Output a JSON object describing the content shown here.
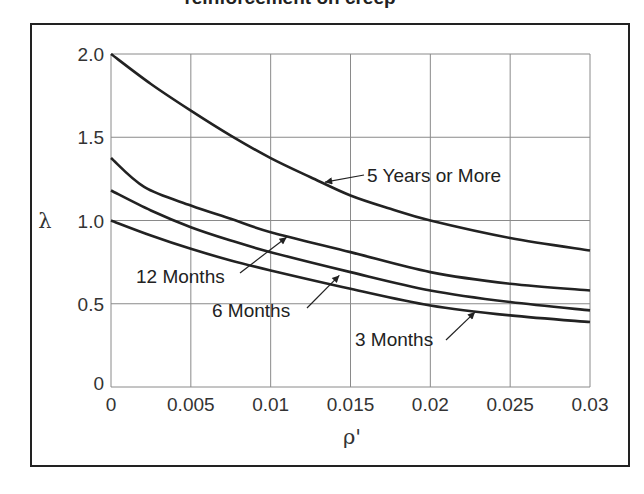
{
  "chart_data": {
    "type": "line",
    "title_visible_fragment": "reinforcement on creep",
    "xlabel": "ρ'",
    "ylabel": "λ",
    "xlim": [
      0,
      0.03
    ],
    "ylim": [
      0,
      2.0
    ],
    "grid": true,
    "x_ticks": [
      "0",
      "0.005",
      "0.01",
      "0.015",
      "0.02",
      "0.025",
      "0.03"
    ],
    "y_ticks": [
      "0",
      "0.5",
      "1.0",
      "1.5",
      "2.0"
    ],
    "x_tick_values": [
      0,
      0.005,
      0.01,
      0.015,
      0.02,
      0.025,
      0.03
    ],
    "y_tick_values": [
      0,
      0.5,
      1.0,
      1.5,
      2.0
    ],
    "series": [
      {
        "name": "5 Years or More",
        "x": [
          0,
          0.0025,
          0.005,
          0.0075,
          0.01,
          0.0125,
          0.015,
          0.0175,
          0.02,
          0.025,
          0.03
        ],
        "values": [
          2.0,
          1.82,
          1.66,
          1.51,
          1.375,
          1.26,
          1.15,
          1.07,
          1.0,
          0.895,
          0.82
        ]
      },
      {
        "name": "12 Months",
        "x": [
          0,
          0.0021,
          0.005,
          0.0075,
          0.01,
          0.015,
          0.02,
          0.025,
          0.03
        ],
        "values": [
          1.375,
          1.2,
          1.09,
          1.01,
          0.93,
          0.81,
          0.69,
          0.62,
          0.58
        ]
      },
      {
        "name": "6 Months",
        "x": [
          0,
          0.0025,
          0.005,
          0.0075,
          0.01,
          0.015,
          0.02,
          0.025,
          0.03
        ],
        "values": [
          1.18,
          1.06,
          0.96,
          0.88,
          0.81,
          0.69,
          0.58,
          0.51,
          0.46
        ]
      },
      {
        "name": "3 Months",
        "x": [
          0,
          0.0025,
          0.005,
          0.0075,
          0.01,
          0.015,
          0.02,
          0.025,
          0.03
        ],
        "values": [
          1.0,
          0.91,
          0.83,
          0.76,
          0.7,
          0.59,
          0.49,
          0.43,
          0.39
        ]
      }
    ],
    "annotations": [
      {
        "text": "5 Years or More",
        "label_x": 0.0159,
        "label_y": 1.25,
        "arrow_to_x": 0.0134,
        "arrow_to_y": 1.23
      },
      {
        "text": "12 Months",
        "label_x": 0.0016,
        "label_y": 0.67,
        "arrow_to_x": 0.011,
        "arrow_to_y": 0.9
      },
      {
        "text": "6 Months",
        "label_x": 0.0063,
        "label_y": 0.46,
        "arrow_to_x": 0.0143,
        "arrow_to_y": 0.67
      },
      {
        "text": "3 Months",
        "label_x": 0.0229,
        "label_y": 0.29,
        "arrow_to_x": 0.0228,
        "arrow_to_y": 0.45
      }
    ],
    "legend": "none (curves labeled with arrows)"
  },
  "colors": {
    "line": "#222222",
    "grid": "#8a8a8a",
    "frame": "#222222",
    "text": "#333333"
  }
}
